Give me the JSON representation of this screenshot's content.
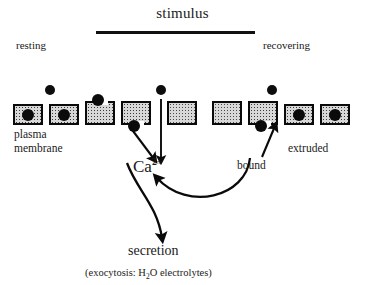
{
  "figure": {
    "title": "stimulus",
    "labels": {
      "resting": "resting",
      "recovering": "recovering",
      "plasma_line_1": "plasma",
      "plasma_line_2": "membrane",
      "calcium": "Ca",
      "calcium_charge": "2+",
      "bound": "bound",
      "extruded": "extruded",
      "secretion": "secretion",
      "footnote_prefix": "(exocytosis: H",
      "footnote_sub": "2",
      "footnote_suffix": "O  electrolytes)"
    },
    "colors": {
      "ink": "#0a0a0a",
      "background": "#ffffff",
      "cell_fill": "#d8d8d8",
      "granule": "#0b0b0b"
    },
    "stimulus_bar": {
      "x": 96,
      "y": 31,
      "width": 159,
      "height": 2.6
    },
    "free_calcium_dots": [
      {
        "x": 45,
        "y": 85,
        "d": 10
      },
      {
        "x": 156,
        "y": 85,
        "d": 10
      },
      {
        "x": 267,
        "y": 85,
        "d": 10
      }
    ],
    "membrane_cells": [
      {
        "id": "cell-1",
        "x": 13,
        "state": "granule-inside",
        "granule": "center"
      },
      {
        "id": "cell-2",
        "x": 49,
        "state": "granule-inside",
        "granule": "center"
      },
      {
        "id": "cell-3",
        "x": 85,
        "state": "granule-fusing-top",
        "granule": "top"
      },
      {
        "id": "cell-4",
        "x": 121,
        "state": "granule-fusing-bottom",
        "granule": "bottom"
      },
      {
        "id": "cell-5",
        "x": 167,
        "state": "empty",
        "granule": "none"
      },
      {
        "id": "cell-6",
        "x": 212,
        "state": "empty",
        "granule": "none"
      },
      {
        "id": "cell-7",
        "x": 248,
        "state": "granule-fusing-bottom",
        "granule": "bottom"
      },
      {
        "id": "cell-8",
        "x": 284,
        "state": "granule-inside",
        "granule": "center"
      },
      {
        "id": "cell-9",
        "x": 320,
        "state": "granule-inside",
        "granule": "center"
      }
    ],
    "arrows": [
      {
        "id": "influx-diagonal",
        "kind": "straight",
        "from": [
          131,
          128
        ],
        "to": [
          155,
          160
        ]
      },
      {
        "id": "influx-vertical",
        "kind": "straight",
        "from": [
          161,
          100
        ],
        "to": [
          161,
          160
        ]
      },
      {
        "id": "extrusion-up",
        "kind": "straight",
        "from": [
          263,
          156
        ],
        "to": [
          275,
          125
        ]
      },
      {
        "id": "ca-to-secretion",
        "kind": "curved",
        "from": [
          128,
          163
        ],
        "to": [
          163,
          243
        ]
      },
      {
        "id": "bound-loop",
        "kind": "curved",
        "from": [
          155,
          170
        ],
        "to": [
          253,
          157
        ]
      }
    ]
  }
}
